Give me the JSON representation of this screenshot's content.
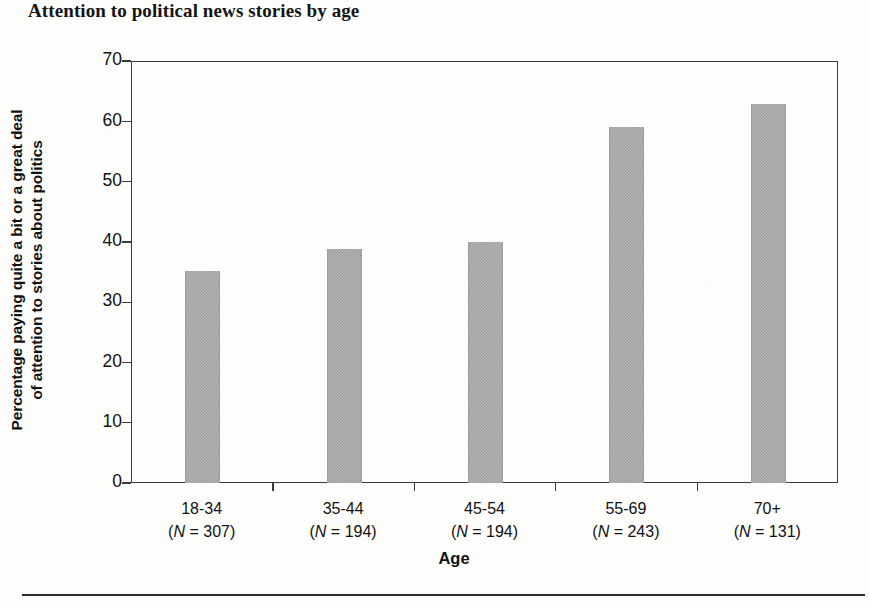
{
  "chart_data": {
    "type": "bar",
    "title": "Attention to political news stories by age",
    "xlabel": "Age",
    "ylabel": "Percentage paying quite a bit or a great deal of attention to stories about politics",
    "ylabel_line1": "Percentage paying quite a bit or a great deal",
    "ylabel_line2": "of attention to stories about politics",
    "categories": [
      "18-34",
      "35-44",
      "45-54",
      "55-69",
      "70+"
    ],
    "category_sublabels": [
      "(N = 307)",
      "(N = 194)",
      "(N = 194)",
      "(N = 243)",
      "(N = 131)"
    ],
    "sample_sizes": [
      307,
      194,
      194,
      243,
      131
    ],
    "values": [
      35.2,
      38.8,
      40.0,
      59.1,
      62.8
    ],
    "ylim": [
      0,
      70
    ],
    "yticks": [
      0,
      10,
      20,
      30,
      40,
      50,
      60,
      70
    ],
    "ytick_labels": [
      "0",
      "10",
      "20",
      "30",
      "40",
      "50",
      "60",
      "70"
    ],
    "grid": false,
    "legend": null,
    "bar_color": "#b4b4b4",
    "axis_color": "#3b3b3b",
    "text_color": "#111111"
  },
  "figure": {
    "bottom_rule": true
  }
}
